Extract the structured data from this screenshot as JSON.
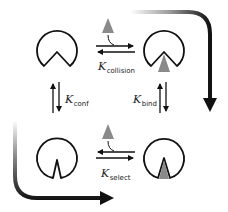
{
  "diagram": {
    "title": "",
    "colors": {
      "outline": "#111111",
      "ligand": "#8a8a8a",
      "arrow": "#111111",
      "background": "#ffffff"
    },
    "states": [
      {
        "id": "open_unbound",
        "position": "top-left",
        "shape": "open-pacman",
        "ligand": false
      },
      {
        "id": "open_bound",
        "position": "top-right",
        "shape": "open-pacman",
        "ligand": true
      },
      {
        "id": "closed_unbound",
        "position": "bottom-left",
        "shape": "closed-notch",
        "ligand": false
      },
      {
        "id": "closed_bound",
        "position": "bottom-right",
        "shape": "closed-notch",
        "ligand": true
      }
    ],
    "labels": {
      "collision": {
        "symbol": "K",
        "subscript": "collision"
      },
      "conf": {
        "symbol": "K",
        "subscript": "conf"
      },
      "bind": {
        "symbol": "K",
        "subscript": "bind"
      },
      "select": {
        "symbol": "K",
        "subscript": "select"
      }
    },
    "transitions": [
      {
        "from": "top-left",
        "to": "top-right",
        "label": "collision",
        "reversible": true,
        "ligand_enters": true
      },
      {
        "from": "top-left",
        "to": "bottom-left",
        "label": "conf",
        "reversible": true
      },
      {
        "from": "top-right",
        "to": "bottom-right",
        "label": "bind",
        "reversible": true
      },
      {
        "from": "bottom-left",
        "to": "bottom-right",
        "label": "select",
        "reversible": true,
        "ligand_enters": true
      }
    ],
    "pathways": [
      {
        "name": "induced-fit-pathway",
        "route": "top-left → top-right → bottom-right",
        "style": "gradient curved arrow"
      },
      {
        "name": "conformational-selection-pathway",
        "route": "top-left → bottom-left → bottom-right",
        "style": "gradient curved arrow"
      }
    ]
  }
}
